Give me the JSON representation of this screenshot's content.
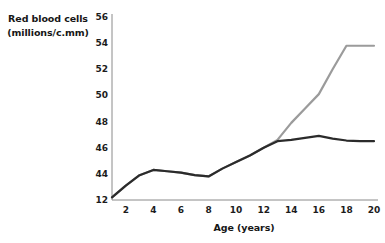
{
  "chart_data": {
    "type": "line",
    "title": "",
    "xlabel": "Age (years)",
    "ylabel": "Red blood cells (millions/c.mm)",
    "ylabel_line1": "Red blood cells",
    "ylabel_line2": "(millions/c.mm)",
    "x": [
      1,
      2,
      3,
      4,
      5,
      6,
      7,
      8,
      9,
      10,
      11,
      12,
      13,
      14,
      15,
      16,
      17,
      18,
      19,
      20
    ],
    "xlim": [
      1,
      20
    ],
    "ylim": [
      42,
      56
    ],
    "xticks": [
      "2",
      "4",
      "6",
      "8",
      "10",
      "12",
      "14",
      "16",
      "18",
      "20"
    ],
    "xtick_values": [
      2,
      4,
      6,
      8,
      10,
      12,
      14,
      16,
      18,
      20
    ],
    "yticks": [
      "12",
      "44",
      "46",
      "48",
      "50",
      "52",
      "54",
      "56"
    ],
    "ytick_values": [
      42,
      44,
      46,
      48,
      50,
      52,
      54,
      56
    ],
    "grid": false,
    "legend": "none",
    "series": [
      {
        "name": "upper-series",
        "color": "#9b9b9b",
        "values": [
          42.2,
          43.1,
          43.9,
          44.3,
          44.2,
          44.1,
          43.9,
          43.8,
          44.4,
          44.9,
          45.4,
          46.0,
          46.6,
          47.9,
          49.0,
          50.1,
          52.0,
          53.8,
          53.8,
          53.8
        ]
      },
      {
        "name": "lower-series",
        "color": "#2b2b2b",
        "values": [
          42.2,
          43.1,
          43.9,
          44.3,
          44.2,
          44.1,
          43.9,
          43.8,
          44.4,
          44.9,
          45.4,
          46.0,
          46.5,
          46.6,
          46.75,
          46.9,
          46.7,
          46.55,
          46.5,
          46.5
        ]
      }
    ]
  }
}
